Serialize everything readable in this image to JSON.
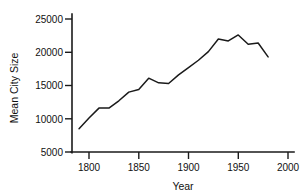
{
  "chart_data": {
    "type": "line",
    "title": "",
    "xlabel": "Year",
    "ylabel": "Mean City Size",
    "xlim": [
      1780,
      2010
    ],
    "ylim": [
      5000,
      25000
    ],
    "grid": false,
    "legend": false,
    "xticks": [
      1800,
      1850,
      1900,
      1950,
      2000
    ],
    "xtick_labels": [
      "1800",
      "1850",
      "1900",
      "1950",
      "2000"
    ],
    "yticks": [
      5000,
      10000,
      15000,
      20000,
      25000
    ],
    "ytick_labels": [
      "5000",
      "10000",
      "15000",
      "20000",
      "25000"
    ],
    "series": [
      {
        "name": "Mean City Size",
        "color": "#1a1a1a",
        "x": [
          1790,
          1800,
          1810,
          1820,
          1830,
          1840,
          1850,
          1860,
          1870,
          1880,
          1890,
          1900,
          1910,
          1920,
          1930,
          1940,
          1950,
          1960,
          1970,
          1980
        ],
        "values": [
          8500,
          10100,
          11600,
          11600,
          12700,
          14000,
          14400,
          16100,
          15400,
          15300,
          16600,
          17700,
          18800,
          20100,
          22000,
          21700,
          22600,
          21200,
          21400,
          19300
        ]
      }
    ]
  },
  "axis_titles": {
    "x": "Year",
    "y": "Mean City Size"
  }
}
